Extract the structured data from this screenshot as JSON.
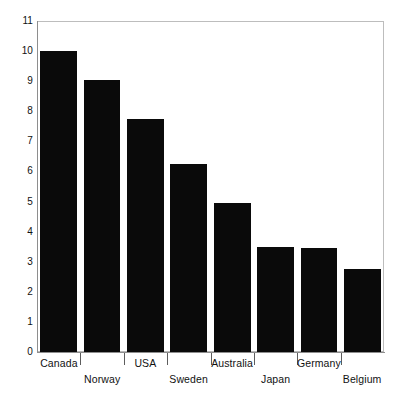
{
  "chart_data": {
    "type": "bar",
    "title": "",
    "subtitle": "",
    "xlabel": "",
    "ylabel": "",
    "categories": [
      "Canada",
      "Norway",
      "USA",
      "Sweden",
      "Australia",
      "Japan",
      "Germany",
      "Belgium"
    ],
    "values": [
      10.0,
      9.05,
      7.75,
      6.25,
      4.95,
      3.5,
      3.45,
      2.75
    ],
    "series": [
      {
        "name": "",
        "values": [
          10.0,
          9.05,
          7.75,
          6.25,
          4.95,
          3.5,
          3.45,
          2.75
        ]
      }
    ],
    "ylim": [
      0,
      11
    ],
    "ytick_labels": [
      "0",
      "1",
      "2",
      "3",
      "4",
      "5",
      "6",
      "7",
      "8",
      "9",
      "10",
      "11"
    ],
    "ytick_values": [
      0,
      1,
      2,
      3,
      4,
      5,
      6,
      7,
      8,
      9,
      10,
      11
    ],
    "grid": false,
    "legend": null,
    "legend_position": "none",
    "bar_color": "#0a0a0a",
    "background_color": "#ffffff",
    "axis_color": "#8e8e8e",
    "label_layout": "staggered-two-row",
    "annotations": []
  }
}
